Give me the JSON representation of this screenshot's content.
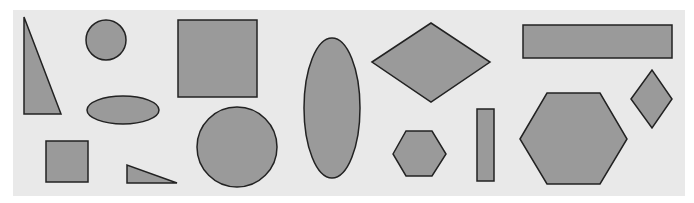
{
  "diagram": {
    "background": "#e9e9e9",
    "shape_fill": "#9a9a9a",
    "shape_stroke": "#222222",
    "shapes": [
      {
        "type": "right-triangle-tall",
        "points": "24,17 24,114 61,114"
      },
      {
        "type": "circle-small",
        "cx": 106,
        "cy": 40,
        "r": 20
      },
      {
        "type": "square-large",
        "x": 178,
        "y": 20,
        "w": 79,
        "h": 77
      },
      {
        "type": "ellipse-horizontal",
        "cx": 123,
        "cy": 110,
        "rx": 36,
        "ry": 14
      },
      {
        "type": "square-small",
        "x": 46,
        "y": 141,
        "w": 42,
        "h": 41
      },
      {
        "type": "right-triangle-flat",
        "points": "127,165 127,183 177,183"
      },
      {
        "type": "circle-large",
        "cx": 237,
        "cy": 147,
        "r": 40
      },
      {
        "type": "ellipse-vertical",
        "cx": 332,
        "cy": 108,
        "rx": 28,
        "ry": 70
      },
      {
        "type": "diamond-wide",
        "points": "372,62 431,23 490,62 431,102"
      },
      {
        "type": "hexagon-small",
        "points": "393,154 406,131 432,131 446,154 432,176 406,176"
      },
      {
        "type": "rect-wide",
        "x": 523,
        "y": 25,
        "w": 149,
        "h": 33
      },
      {
        "type": "rect-tall",
        "x": 477,
        "y": 109,
        "w": 17,
        "h": 72
      },
      {
        "type": "hexagon-large",
        "points": "520,139 547,93 600,93 627,139 600,184 547,184"
      },
      {
        "type": "diamond-small",
        "points": "631,99 652,70 672,99 652,128"
      }
    ]
  }
}
